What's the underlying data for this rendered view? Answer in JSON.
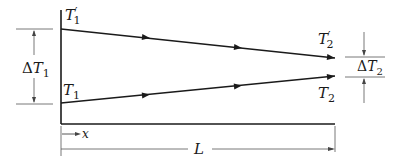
{
  "diagram": {
    "type": "counterflow heat exchanger temperature profile",
    "labels": {
      "hot_inlet": {
        "symbol": "T",
        "sub": "1",
        "prime": "′"
      },
      "cold_outlet": {
        "symbol": "T",
        "sub": "1"
      },
      "hot_outlet": {
        "symbol": "T",
        "sub": "2",
        "prime": "′"
      },
      "cold_inlet": {
        "symbol": "T",
        "sub": "2"
      },
      "delta_t1": {
        "delta": "Δ",
        "symbol": "T",
        "sub": "1"
      },
      "delta_t2": {
        "delta": "Δ",
        "symbol": "T",
        "sub": "2"
      },
      "x_axis": "x",
      "length": "L"
    },
    "lines": [
      {
        "name": "upper-stream",
        "from": "T′1",
        "to": "T′2",
        "direction": "left-to-right"
      },
      {
        "name": "lower-stream",
        "from": "T1",
        "to": "T2",
        "direction": "left-to-right"
      }
    ],
    "colors": {
      "stroke": "#1a1a1a",
      "thin": "#555555",
      "background": "#ffffff"
    }
  }
}
